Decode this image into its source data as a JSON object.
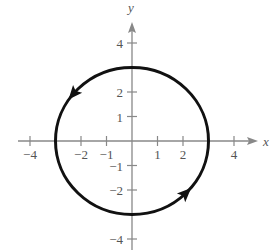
{
  "diagram": {
    "type": "parametric-circle",
    "radius": 3,
    "center": [
      0,
      0
    ],
    "orientation": "counterclockwise",
    "axes": {
      "x_label": "x",
      "y_label": "y",
      "x_ticks": [
        {
          "value": -4,
          "label": "−4"
        },
        {
          "value": -2,
          "label": "−2"
        },
        {
          "value": -1,
          "label": "−1"
        },
        {
          "value": 1,
          "label": "1"
        },
        {
          "value": 2,
          "label": "2"
        },
        {
          "value": 4,
          "label": "4"
        }
      ],
      "y_ticks": [
        {
          "value": 4,
          "label": "4"
        },
        {
          "value": 2,
          "label": "2"
        },
        {
          "value": 1,
          "label": "1"
        },
        {
          "value": -1,
          "label": "−1"
        },
        {
          "value": -2,
          "label": "−2"
        },
        {
          "value": -4,
          "label": "−4"
        }
      ]
    },
    "colors": {
      "axis": "#888888",
      "curve": "#111111",
      "label": "#555555"
    }
  }
}
